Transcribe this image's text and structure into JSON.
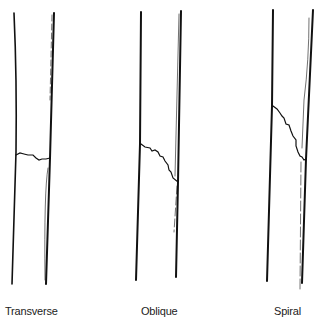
{
  "figure": {
    "panels": [
      {
        "label": "Transverse"
      },
      {
        "label": "Oblique"
      },
      {
        "label": "Spiral"
      }
    ]
  },
  "colors": {
    "line": "#111111",
    "background": "#ffffff",
    "label": "#222222"
  }
}
